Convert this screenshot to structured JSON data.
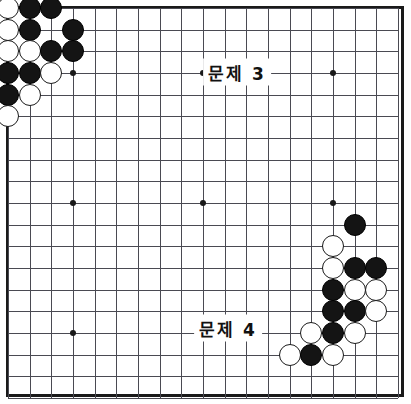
{
  "figure": {
    "background_color": "#ffffff",
    "board": {
      "name": "goban",
      "size": 19,
      "line_color": "#4a4a52",
      "border_color": "#1a1a1a",
      "origin_x": 8,
      "origin_y": 8,
      "spacing": 21.67,
      "stone_radius": 11
    },
    "colors": {
      "black_stone": "#141414",
      "white_stone": "#ffffff",
      "stone_outline": "#1a1a1a",
      "grid": "#4a4a52",
      "label_text": "#111111"
    }
  },
  "labels": [
    {
      "id": "problem-3",
      "text": "문제 3",
      "x": 237,
      "y": 72
    },
    {
      "id": "problem-4",
      "text": "문제 4",
      "x": 228,
      "y": 328
    }
  ],
  "star_points": [
    {
      "col": 3,
      "row": 3
    },
    {
      "col": 9,
      "row": 3
    },
    {
      "col": 15,
      "row": 3
    },
    {
      "col": 3,
      "row": 9
    },
    {
      "col": 9,
      "row": 9
    },
    {
      "col": 15,
      "row": 9
    },
    {
      "col": 3,
      "row": 15
    },
    {
      "col": 9,
      "row": 15
    },
    {
      "col": 15,
      "row": 15
    }
  ],
  "stones": [
    {
      "col": 0,
      "row": 0,
      "color": "white"
    },
    {
      "col": 1,
      "row": 0,
      "color": "black"
    },
    {
      "col": 2,
      "row": 0,
      "color": "black"
    },
    {
      "col": 0,
      "row": 1,
      "color": "white"
    },
    {
      "col": 1,
      "row": 1,
      "color": "black"
    },
    {
      "col": 3,
      "row": 1,
      "color": "black"
    },
    {
      "col": 0,
      "row": 2,
      "color": "white"
    },
    {
      "col": 1,
      "row": 2,
      "color": "white"
    },
    {
      "col": 2,
      "row": 2,
      "color": "black"
    },
    {
      "col": 3,
      "row": 2,
      "color": "black"
    },
    {
      "col": 0,
      "row": 3,
      "color": "black"
    },
    {
      "col": 1,
      "row": 3,
      "color": "black"
    },
    {
      "col": 2,
      "row": 3,
      "color": "white"
    },
    {
      "col": 0,
      "row": 4,
      "color": "black"
    },
    {
      "col": 1,
      "row": 4,
      "color": "white"
    },
    {
      "col": 0,
      "row": 5,
      "color": "white"
    },
    {
      "col": 16,
      "row": 10,
      "color": "black"
    },
    {
      "col": 15,
      "row": 11,
      "color": "white"
    },
    {
      "col": 15,
      "row": 12,
      "color": "white"
    },
    {
      "col": 16,
      "row": 12,
      "color": "black"
    },
    {
      "col": 17,
      "row": 12,
      "color": "black"
    },
    {
      "col": 15,
      "row": 13,
      "color": "black"
    },
    {
      "col": 16,
      "row": 13,
      "color": "white"
    },
    {
      "col": 17,
      "row": 13,
      "color": "white"
    },
    {
      "col": 15,
      "row": 14,
      "color": "black"
    },
    {
      "col": 16,
      "row": 14,
      "color": "black"
    },
    {
      "col": 17,
      "row": 14,
      "color": "white"
    },
    {
      "col": 14,
      "row": 15,
      "color": "white"
    },
    {
      "col": 15,
      "row": 15,
      "color": "black"
    },
    {
      "col": 16,
      "row": 15,
      "color": "white"
    },
    {
      "col": 13,
      "row": 16,
      "color": "white"
    },
    {
      "col": 14,
      "row": 16,
      "color": "black"
    },
    {
      "col": 15,
      "row": 16,
      "color": "white"
    }
  ]
}
